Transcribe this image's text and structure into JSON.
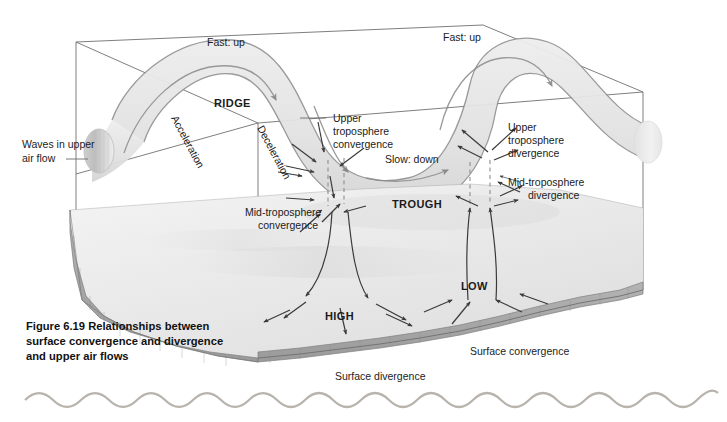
{
  "figure": {
    "caption_line1": "Figure 6.19  Relationships between",
    "caption_line2": "surface convergence and divergence",
    "caption_line3": "and upper air flows"
  },
  "labels": {
    "waves_line1": "Waves in upper",
    "waves_line2": "air flow",
    "fast_up_left": "Fast: up",
    "fast_up_right": "Fast: up",
    "ridge": "RIDGE",
    "trough": "TROUGH",
    "acceleration": "Acceleration",
    "deceleration": "Deceleration",
    "slow_down": "Slow: down",
    "upper_conv_line1": "Upper",
    "upper_conv_line2": "troposphere",
    "upper_conv_line3": "convergence",
    "upper_div_line1": "Upper",
    "upper_div_line2": "troposphere",
    "upper_div_line3": "divergence",
    "mid_conv_line1": "Mid-troposphere",
    "mid_conv_line2": "convergence",
    "mid_div_line1": "Mid-troposphere",
    "mid_div_line2": "divergence",
    "high": "HIGH",
    "low": "LOW",
    "surface_convergence": "Surface convergence",
    "surface_divergence": "Surface divergence"
  },
  "colors": {
    "background": "#ffffff",
    "ribbon_fill": "#e3e3e3",
    "terrain_top": "#ececec",
    "terrain_side": "#a9a9a9",
    "box_stroke": "#6f6f6f",
    "arrow_dark": "#3a3a3a",
    "arrow_mid": "#7d7d7d",
    "wave_decor": "#b8b3ad",
    "text": "#1b1b1b"
  }
}
